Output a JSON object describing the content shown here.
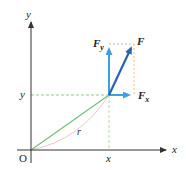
{
  "diagram": {
    "type": "vector-decomposition",
    "axes": {
      "x_label": "x",
      "y_label": "y",
      "origin_label": "O"
    },
    "point": {
      "x_label": "x",
      "y_label": "y",
      "radius_label": "r"
    },
    "vectors": {
      "F": {
        "label": "F",
        "color": "#2b63b0"
      },
      "Fx": {
        "label": "F",
        "subscript": "x",
        "color": "#3ea0e0"
      },
      "Fy": {
        "label": "F",
        "subscript": "y",
        "color": "#3ea0e0"
      }
    },
    "colors": {
      "axis": "#333333",
      "radius_line": "#6cbf78",
      "guide_dashed": "#8ccf8c",
      "projection_dashed": "#f0c070",
      "arc": "#f4b8b8",
      "component_box": "#b0b0b0"
    }
  }
}
